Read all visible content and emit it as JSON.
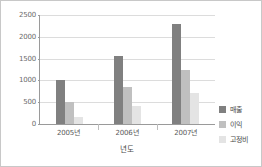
{
  "chart_data": {
    "type": "bar",
    "title": "",
    "subtitle": "",
    "xlabel": "년도",
    "ylabel": "",
    "categories": [
      "2005년",
      "2006년",
      "2007년"
    ],
    "series": [
      {
        "name": "매출",
        "color": "#808080",
        "values": [
          1000,
          1560,
          2300
        ]
      },
      {
        "name": "이익",
        "color": "#c0c0c0",
        "values": [
          500,
          850,
          1250
        ]
      },
      {
        "name": "고정비",
        "color": "#e4e4e4",
        "values": [
          150,
          420,
          700
        ]
      }
    ],
    "ylim": [
      0,
      2500
    ],
    "yticks": [
      0,
      500,
      1000,
      1500,
      2000,
      2500
    ],
    "ytick_labels": [
      "0",
      "500",
      "1000",
      "1500",
      "2000",
      "2500"
    ],
    "grid": true,
    "grid_axis": "y",
    "legend_position": "right"
  },
  "axis": {
    "y_labels": [
      "2500",
      "2000",
      "1500",
      "1000",
      "500",
      "0"
    ],
    "x_labels": [
      "2005년",
      "2006년",
      "2007년"
    ],
    "x_title": "년도"
  },
  "legend": {
    "entries": [
      {
        "label": "매출"
      },
      {
        "label": "이익"
      },
      {
        "label": "고정비"
      }
    ]
  }
}
